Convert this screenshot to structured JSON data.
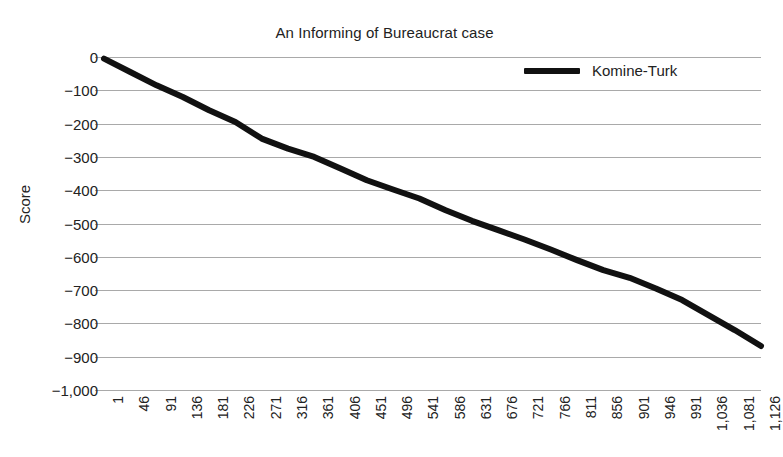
{
  "chart_data": {
    "type": "line",
    "title": "An Informing of Bureaucrat case",
    "xlabel": "",
    "ylabel": "Score",
    "ylim": [
      -1000,
      0
    ],
    "xlim": [
      1,
      1126
    ],
    "grid": true,
    "legend_position": "top-right",
    "y_ticks": [
      "0",
      "−100",
      "−200",
      "−300",
      "−400",
      "−500",
      "−600",
      "−700",
      "−800",
      "−900",
      "−1,000"
    ],
    "y_tick_values": [
      0,
      -100,
      -200,
      -300,
      -400,
      -500,
      -600,
      -700,
      -800,
      -900,
      -1000
    ],
    "x_ticks": [
      "1",
      "46",
      "91",
      "136",
      "181",
      "226",
      "271",
      "316",
      "361",
      "406",
      "451",
      "496",
      "541",
      "586",
      "631",
      "676",
      "721",
      "766",
      "811",
      "856",
      "901",
      "946",
      "991",
      "1,036",
      "1,081",
      "1,126"
    ],
    "x_tick_values": [
      1,
      46,
      91,
      136,
      181,
      226,
      271,
      316,
      361,
      406,
      451,
      496,
      541,
      586,
      631,
      676,
      721,
      766,
      811,
      856,
      901,
      946,
      991,
      1036,
      1081,
      1126
    ],
    "series": [
      {
        "name": "Komine-Turk",
        "color": "#111111",
        "x": [
          1,
          46,
          91,
          136,
          181,
          226,
          271,
          316,
          361,
          406,
          451,
          496,
          541,
          586,
          631,
          676,
          721,
          766,
          811,
          856,
          901,
          946,
          991,
          1036,
          1081,
          1126
        ],
        "values": [
          -5,
          -45,
          -85,
          -120,
          -160,
          -195,
          -245,
          -275,
          -300,
          -335,
          -370,
          -398,
          -425,
          -460,
          -492,
          -520,
          -548,
          -578,
          -610,
          -640,
          -663,
          -695,
          -730,
          -775,
          -820,
          -868
        ]
      }
    ],
    "legend": [
      "Komine-Turk"
    ],
    "annotations": []
  },
  "axis": {
    "y_title": "Score"
  },
  "clipped_top_text": ""
}
